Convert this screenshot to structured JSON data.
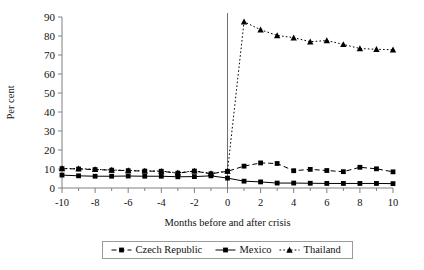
{
  "chart_data": {
    "type": "line",
    "title": "",
    "xlabel": "Months before and after crisis",
    "ylabel": "Per cent",
    "x": [
      -10,
      -9,
      -8,
      -7,
      -6,
      -5,
      -4,
      -3,
      -2,
      -1,
      0,
      1,
      2,
      3,
      4,
      5,
      6,
      7,
      8,
      9,
      10
    ],
    "xlim": [
      -10,
      10
    ],
    "ylim": [
      0,
      90
    ],
    "xticks": [
      -10,
      -8,
      -6,
      -4,
      -2,
      0,
      2,
      4,
      6,
      8,
      10
    ],
    "xtick_labels": [
      "-10",
      "-8",
      "-6",
      "-4",
      "-2",
      "0",
      "2",
      "4",
      "6",
      "8",
      "10"
    ],
    "yticks": [
      0,
      10,
      20,
      30,
      40,
      50,
      60,
      70,
      80,
      90
    ],
    "ytick_labels": [
      "0",
      "10",
      "20",
      "30",
      "40",
      "50",
      "60",
      "70",
      "80",
      "90"
    ],
    "grid": false,
    "legend_position": "bottom",
    "annotations": [
      {
        "name": "crisis-marker",
        "type": "vline",
        "x": 0
      }
    ],
    "series": [
      {
        "name": "Czech Republic",
        "marker": "square",
        "linestyle": "dashed",
        "color": "#000000",
        "values": [
          10.2,
          10.0,
          9.7,
          9.4,
          9.1,
          8.9,
          8.8,
          7.8,
          8.9,
          7.5,
          8.8,
          11.5,
          13.2,
          12.9,
          9.1,
          9.8,
          9.2,
          8.6,
          10.9,
          10.1,
          8.5
        ]
      },
      {
        "name": "Mexico",
        "marker": "square",
        "linestyle": "solid",
        "color": "#000000",
        "values": [
          6.8,
          6.4,
          6.2,
          6.2,
          6.3,
          6.2,
          6.2,
          5.9,
          6.0,
          6.4,
          5.2,
          3.6,
          3.2,
          2.6,
          2.6,
          2.5,
          2.4,
          2.4,
          2.4,
          2.4,
          2.3
        ]
      },
      {
        "name": "Thailand",
        "marker": "triangle",
        "linestyle": "dotted",
        "color": "#000000",
        "values": [
          10.3,
          10.2,
          9.8,
          9.5,
          9.2,
          9.0,
          8.9,
          8.0,
          9.0,
          7.6,
          8.9,
          87.5,
          83.3,
          80.3,
          79.1,
          77.0,
          77.6,
          75.6,
          73.4,
          73.0,
          72.8
        ]
      }
    ]
  },
  "legend": {
    "items": [
      {
        "label": "Czech Republic"
      },
      {
        "label": "Mexico"
      },
      {
        "label": "Thailand"
      }
    ]
  }
}
